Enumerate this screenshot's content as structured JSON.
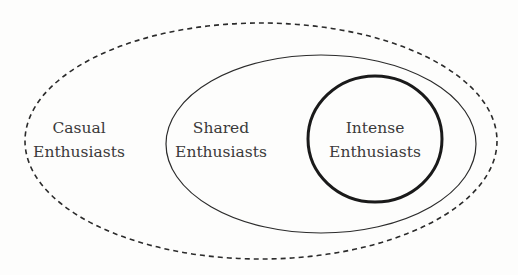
{
  "diagram": {
    "type": "nested-sets",
    "sets": [
      {
        "id": "casual",
        "label_line1": "Casual",
        "label_line2": "Enthusiasts",
        "style": "dashed ellipse",
        "level": "outer"
      },
      {
        "id": "shared",
        "label_line1": "Shared",
        "label_line2": "Enthusiasts",
        "style": "thin solid ellipse",
        "level": "middle"
      },
      {
        "id": "intense",
        "label_line1": "Intense",
        "label_line2": "Enthusiasts",
        "style": "thick solid circle",
        "level": "inner"
      }
    ],
    "colors": {
      "stroke": "#2b2b2b",
      "text": "#3a3a3a",
      "background": "#fdfdfc"
    }
  }
}
